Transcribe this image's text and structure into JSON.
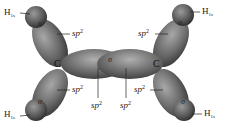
{
  "diagram": {
    "atoms": {
      "carbon_left": "C",
      "carbon_right": "C"
    },
    "hydrogen_label": {
      "base": "H",
      "sub": "1s"
    },
    "orbital_label": {
      "base": "sp",
      "sup": "2"
    },
    "bond_symbol": "σ",
    "colors": {
      "orbital_dark": "#4a4a4a",
      "orbital_light": "#9a9a9a",
      "background": "#ffffff",
      "text": "#222222"
    }
  }
}
